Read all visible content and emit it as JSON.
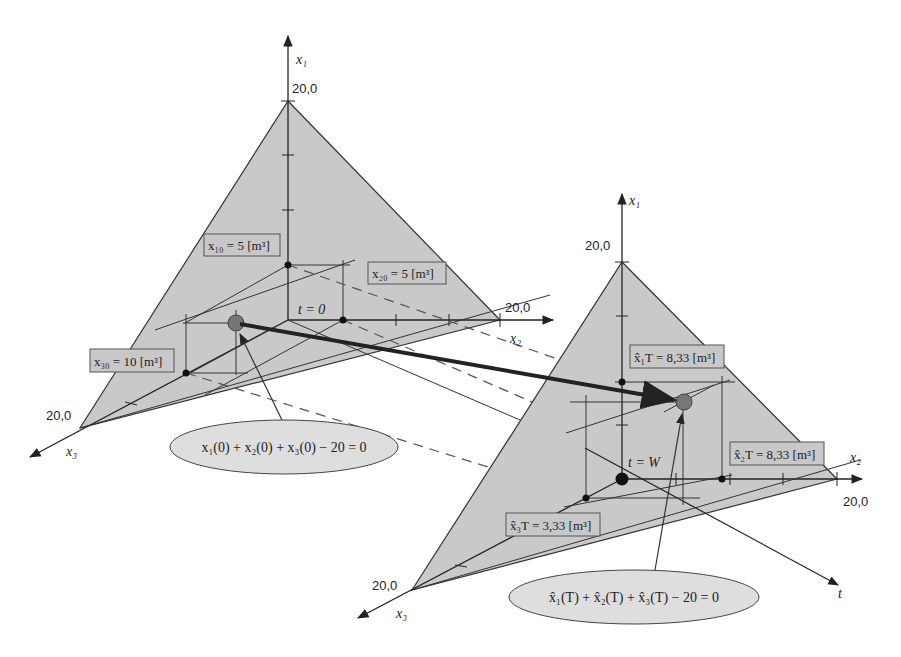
{
  "colors": {
    "plane_fill": "#c9c9c9",
    "line": "#333333",
    "dashed": "#555555",
    "trajectory": "#222222",
    "point": "#777777",
    "ellipse_fill": "#dedede",
    "label_fill": "#c8c8c8"
  },
  "left": {
    "axis_x1": "x₁",
    "axis_x2": "x₂",
    "axis_x3": "x₃",
    "x1_max": "20,0",
    "x2_max": "20,0",
    "x3_max": "20,0",
    "time_label": "t = 0",
    "label_x10": "x₁₀ = 5 [m³]",
    "label_x20": "x₂₀ = 5 [m³]",
    "label_x30": "x₃₀ = 10 [m³]",
    "constraint": "x₁(0) + x₂(0) + x₃(0) − 20 = 0",
    "values": {
      "x1": 5,
      "x2": 5,
      "x3": 10
    }
  },
  "right": {
    "axis_x1": "x₁",
    "axis_x2": "x₂",
    "axis_x3": "x₃",
    "axis_t": "t",
    "x1_max": "20,0",
    "x2_max": "20,0",
    "x3_max": "20,0",
    "time_label": "t = W",
    "label_x1T": "x̂₁T = 8,33 [m³]",
    "label_x2T": "x̂₂T = 8,33 [m³]",
    "label_x3T": "x̂₃T = 3,33 [m³]",
    "constraint": "x̂₁(T) + x̂₂(T) + x̂₃(T) − 20 = 0",
    "values": {
      "x1": 8.33,
      "x2": 8.33,
      "x3": 3.33
    }
  }
}
